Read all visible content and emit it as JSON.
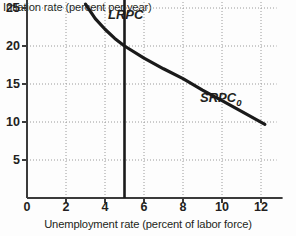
{
  "chart_data": {
    "type": "line",
    "title": "",
    "xlabel": "Unemployment rate (percent of labor force)",
    "ylabel": "Inflation rate (percent per year)",
    "xlim": [
      0,
      12.8
    ],
    "ylim": [
      0,
      27
    ],
    "xticks": [
      0,
      2,
      4,
      6,
      8,
      10,
      12
    ],
    "xtick_labels": [
      "0",
      "2",
      "4",
      "6",
      "8",
      "10",
      "12"
    ],
    "yticks": [
      5,
      10,
      15,
      20,
      25
    ],
    "ytick_labels": [
      "5",
      "10",
      "15",
      "20",
      "25"
    ],
    "grid": true,
    "grid_style": "dotted",
    "legend": "none",
    "series": [
      {
        "name": "SRPC0",
        "label": "SRPC",
        "label_subscript": "0",
        "type": "curve",
        "x": [
          3.0,
          3.5,
          4.0,
          4.5,
          5.0,
          6.0,
          7.0,
          8.0,
          9.0,
          10.0,
          11.0,
          12.2
        ],
        "y": [
          25.5,
          23.6,
          22.2,
          21.0,
          20.0,
          18.4,
          17.0,
          15.7,
          14.2,
          12.8,
          11.4,
          9.7
        ],
        "color": "#1a1a1a"
      },
      {
        "name": "LRPC",
        "label": "LRPC",
        "type": "vertical-line",
        "x": 5.0,
        "y_from": 0.0,
        "y_to": 26.3,
        "color": "#1a1a1a"
      }
    ],
    "annotations": [
      {
        "name": "intersection",
        "x": 5.0,
        "y": 20.0,
        "note": "SRPC0 crosses LRPC"
      }
    ],
    "colors": {
      "background": "#fdfdfd",
      "axis": "#3b3b3b",
      "grid": "#9a9a9a",
      "text": "#231f20",
      "curve": "#1a1a1a"
    }
  }
}
